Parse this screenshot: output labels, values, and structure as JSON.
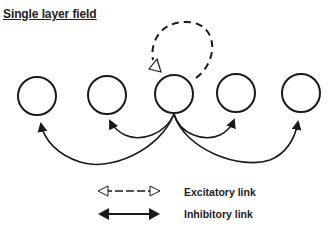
{
  "title": "Single layer field",
  "nodes": [
    {
      "id": "node-1",
      "cx": 37,
      "cy": 96
    },
    {
      "id": "node-2",
      "cx": 107,
      "cy": 95
    },
    {
      "id": "node-3",
      "cx": 174,
      "cy": 94
    },
    {
      "id": "node-4",
      "cx": 236,
      "cy": 93
    },
    {
      "id": "node-5",
      "cx": 301,
      "cy": 93
    }
  ],
  "links": [
    {
      "from": "node-3",
      "to": "node-3",
      "type": "excitatory",
      "shape": "self-loop"
    },
    {
      "from": "node-3",
      "to": "node-1",
      "type": "inhibitory"
    },
    {
      "from": "node-3",
      "to": "node-2",
      "type": "inhibitory"
    },
    {
      "from": "node-3",
      "to": "node-4",
      "type": "inhibitory"
    },
    {
      "from": "node-3",
      "to": "node-5",
      "type": "inhibitory"
    }
  ],
  "legend": {
    "excitatory": "Excitatory link",
    "inhibitory": "Inhibitory link"
  },
  "colors": {
    "stroke": "#1a1a1a",
    "background": "#ffffff"
  }
}
